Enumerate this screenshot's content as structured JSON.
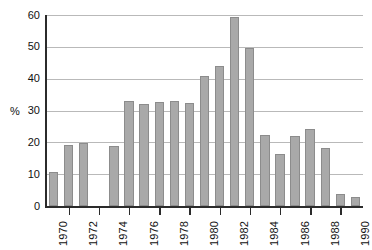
{
  "chart_data": {
    "type": "bar",
    "title": "",
    "xlabel": "",
    "ylabel": "%",
    "ylim": [
      0,
      60
    ],
    "yticks": [
      0,
      10,
      20,
      30,
      40,
      50,
      60
    ],
    "grid": true,
    "legend": "none",
    "xtick_labels": [
      "1970",
      "1972",
      "1974",
      "1976",
      "1978",
      "1980",
      "1982",
      "1984",
      "1986",
      "1988",
      "1990"
    ],
    "categories": [
      "1970",
      "1971",
      "1972",
      "1973",
      "1974",
      "1975",
      "1976",
      "1977",
      "1978",
      "1979",
      "1980",
      "1981",
      "1982",
      "1983",
      "1984",
      "1985",
      "1986",
      "1987",
      "1988",
      "1989",
      "1990"
    ],
    "values": [
      10.8,
      19.4,
      19.9,
      null,
      19.1,
      33.2,
      32.1,
      32.9,
      33.1,
      32.6,
      41.1,
      44.0,
      59.5,
      49.8,
      22.3,
      16.6,
      22.2,
      24.2,
      18.2,
      3.9,
      3.1
    ],
    "series": [
      {
        "name": "percent",
        "values": [
          10.8,
          19.4,
          19.9,
          null,
          19.1,
          33.2,
          32.1,
          32.9,
          33.1,
          32.6,
          41.1,
          44.0,
          59.5,
          49.8,
          22.3,
          16.6,
          22.2,
          24.2,
          18.2,
          3.9,
          3.1
        ]
      }
    ],
    "bar_color": "#a9a9a9",
    "bar_edge_color": "#8c8c8c",
    "axis_color": "#2b2b2b",
    "grid_color": "#b9b9b9"
  }
}
